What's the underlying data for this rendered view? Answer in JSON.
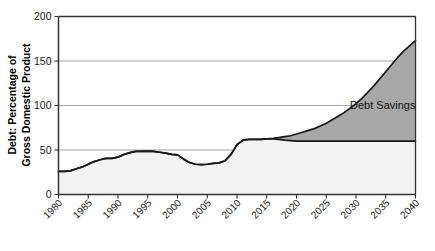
{
  "chart_data": {
    "type": "area",
    "title": "",
    "subtitle": "",
    "xlabel": "",
    "ylabel_line1": "Debt: Percentage of",
    "ylabel_line2": "Gross Domestic Product",
    "xlim": [
      1980,
      2040
    ],
    "ylim": [
      0,
      200
    ],
    "grid": true,
    "legend_position": "none",
    "x_tick_labels": [
      "1980",
      "1985",
      "1990",
      "1995",
      "2000",
      "2005",
      "2010",
      "2015",
      "2020",
      "2025",
      "2030",
      "2035",
      "2040"
    ],
    "x_ticks": [
      1980,
      1985,
      1990,
      1995,
      2000,
      2005,
      2010,
      2015,
      2020,
      2025,
      2030,
      2035,
      2040
    ],
    "y_tick_labels": [
      "0",
      "50",
      "100",
      "150",
      "200"
    ],
    "y_ticks": [
      0,
      50,
      100,
      150,
      200
    ],
    "annotations": [
      {
        "text": "Debt Savings",
        "x": 2029,
        "y": 96,
        "name": "debt-savings-label"
      }
    ],
    "colors": {
      "projection_line": "#1a1a1a",
      "baseline_line": "#1a1a1a",
      "savings_fill": "#a8a8a8",
      "baseline_fill": "#f2f2f2",
      "gridline": "#9a9a9a",
      "axis": "#333333",
      "background": "#ffffff"
    },
    "series": [
      {
        "name": "Projected Debt",
        "role": "upper",
        "x": [
          1980,
          1981,
          1982,
          1983,
          1984,
          1985,
          1986,
          1987,
          1988,
          1989,
          1990,
          1991,
          1992,
          1993,
          1994,
          1995,
          1996,
          1997,
          1998,
          1999,
          2000,
          2001,
          2002,
          2003,
          2004,
          2005,
          2006,
          2007,
          2008,
          2009,
          2010,
          2011,
          2012,
          2013,
          2014,
          2015,
          2016,
          2017,
          2018,
          2019,
          2020,
          2021,
          2022,
          2023,
          2024,
          2025,
          2026,
          2027,
          2028,
          2029,
          2030,
          2031,
          2032,
          2033,
          2034,
          2035,
          2036,
          2037,
          2038,
          2039,
          2040
        ],
        "values": [
          26,
          26,
          26.5,
          29,
          31,
          34,
          37,
          39,
          40.5,
          40.5,
          42,
          45,
          47,
          48.5,
          48.5,
          48.8,
          48.5,
          47.5,
          46.5,
          45,
          44.5,
          40,
          36,
          34,
          33.5,
          34,
          35,
          35.5,
          38,
          45,
          56,
          61,
          62,
          62,
          62,
          62.5,
          63,
          64,
          65,
          66,
          68,
          70,
          72,
          74,
          77,
          80,
          84,
          88,
          92,
          97,
          102,
          108,
          115,
          122,
          130,
          138,
          146,
          154,
          161,
          167,
          173
        ]
      },
      {
        "name": "Debt with Savings (Baseline)",
        "role": "lower",
        "x": [
          1980,
          1981,
          1982,
          1983,
          1984,
          1985,
          1986,
          1987,
          1988,
          1989,
          1990,
          1991,
          1992,
          1993,
          1994,
          1995,
          1996,
          1997,
          1998,
          1999,
          2000,
          2001,
          2002,
          2003,
          2004,
          2005,
          2006,
          2007,
          2008,
          2009,
          2010,
          2011,
          2012,
          2013,
          2014,
          2015,
          2016,
          2017,
          2018,
          2019,
          2020,
          2021,
          2022,
          2023,
          2024,
          2025,
          2026,
          2027,
          2028,
          2029,
          2030,
          2031,
          2032,
          2033,
          2034,
          2035,
          2036,
          2037,
          2038,
          2039,
          2040
        ],
        "values": [
          26,
          26,
          26.5,
          29,
          31,
          34,
          37,
          39,
          40.5,
          40.5,
          42,
          45,
          47,
          48.5,
          48.5,
          48.8,
          48.5,
          47.5,
          46.5,
          45,
          44.5,
          40,
          36,
          34,
          33.5,
          34,
          35,
          35.5,
          38,
          45,
          56,
          61,
          62,
          62,
          62,
          62.5,
          62.5,
          62,
          61,
          60.5,
          60,
          60,
          60,
          60,
          60,
          60,
          60,
          60,
          60,
          60,
          60,
          60,
          60,
          60,
          60,
          60,
          60,
          60,
          60,
          60,
          60
        ]
      }
    ]
  }
}
